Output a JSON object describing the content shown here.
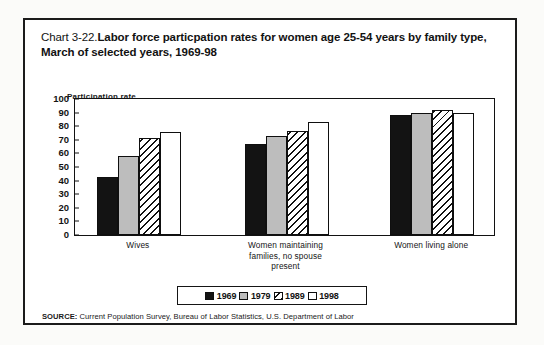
{
  "document": {
    "background_color": "#fbfbf9",
    "frame_color": "#1b1b1b"
  },
  "title": {
    "prefix": "Chart 3-22.",
    "text": "Labor force particpation rates for women age 25-54 years by family type, March of selected years, 1969-98",
    "full": "Chart 3-22.Labor force particpation rates for women age 25-54 years by family type, March of selected years, 1969-98"
  },
  "axis": {
    "y_caption": "Participation rate",
    "y_ticks": [
      "100",
      "90",
      "80",
      "70",
      "60",
      "50",
      "40",
      "30",
      "20",
      "10",
      "0"
    ]
  },
  "legend": {
    "items": [
      {
        "label": "1969",
        "pattern": "solid-black",
        "color": "#131313"
      },
      {
        "label": "1979",
        "pattern": "solid-gray",
        "color": "#bdbdbd"
      },
      {
        "label": "1989",
        "pattern": "diagonal-hatch",
        "color": "#ffffff"
      },
      {
        "label": "1998",
        "pattern": "open-white",
        "color": "#ffffff"
      }
    ]
  },
  "source": {
    "tag": "SOURCE:",
    "text": " Current Population Survey, Bureau of Labor Statistics, U.S. Department of Labor",
    "full": "SOURCE: Current Population Survey, Bureau of Labor Statistics, U.S. Department of Labor"
  },
  "chart_data": {
    "type": "bar",
    "title": "Chart 3-22.Labor force particpation rates for women age 25-54 years by family type, March of selected years, 1969-98",
    "xlabel": "",
    "ylabel": "Participation rate",
    "ylim": [
      0,
      100
    ],
    "ytick_step": 10,
    "grid": false,
    "legend_position": "bottom-center",
    "categories": [
      "Wives",
      "Women maintaining families, no spouse present",
      "Women living alone"
    ],
    "category_lines": [
      [
        "Wives"
      ],
      [
        "Women maintaining",
        "families, no spouse",
        "present"
      ],
      [
        "Women living alone"
      ]
    ],
    "series": [
      {
        "name": "1969",
        "pattern": "solid-black",
        "values": [
          43,
          67,
          88
        ]
      },
      {
        "name": "1979",
        "pattern": "solid-gray",
        "values": [
          58,
          72.5,
          90
        ]
      },
      {
        "name": "1989",
        "pattern": "diagonal-hatch",
        "values": [
          71,
          76.5,
          92
        ]
      },
      {
        "name": "1998",
        "pattern": "open-white",
        "values": [
          76,
          83,
          90
        ]
      }
    ]
  }
}
